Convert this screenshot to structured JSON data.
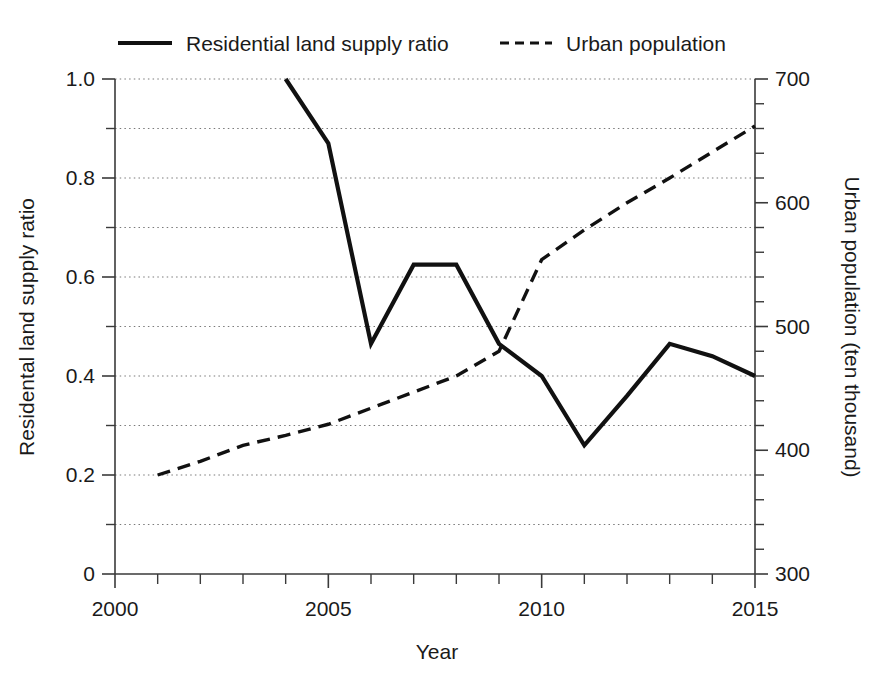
{
  "chart_data": {
    "type": "line",
    "title": "",
    "xlabel": "Year",
    "ylabel": "Residental land supply ratio",
    "y2label": "Urban population (ten thousand)",
    "xlim": [
      2000,
      2015
    ],
    "ylim": [
      0,
      1.0
    ],
    "y2lim": [
      300,
      700
    ],
    "grid": true,
    "legend_position": "top",
    "x_ticks": [
      2000,
      2001,
      2002,
      2003,
      2004,
      2005,
      2006,
      2007,
      2008,
      2009,
      2010,
      2011,
      2012,
      2013,
      2014,
      2015
    ],
    "x_tick_labels": [
      "2000",
      "",
      "",
      "",
      "",
      "2005",
      "",
      "",
      "",
      "",
      "2010",
      "",
      "",
      "",
      "",
      "2015"
    ],
    "y_ticks": [
      0,
      0.1,
      0.2,
      0.3,
      0.4,
      0.5,
      0.6,
      0.7,
      0.8,
      0.9,
      1.0
    ],
    "y_tick_labels": [
      "0",
      "",
      "0.2",
      "",
      "0.4",
      "",
      "0.6",
      "",
      "0.8",
      "",
      "1.0"
    ],
    "y2_ticks": [
      300,
      320,
      340,
      360,
      380,
      400,
      420,
      440,
      460,
      480,
      500,
      520,
      540,
      560,
      580,
      600,
      620,
      640,
      660,
      680,
      700
    ],
    "y2_tick_labels": [
      "300",
      "",
      "",
      "",
      "",
      "400",
      "",
      "",
      "",
      "",
      "500",
      "",
      "",
      "",
      "",
      "600",
      "",
      "",
      "",
      "",
      "700"
    ],
    "series": [
      {
        "name": "Residential land supply ratio",
        "axis": "left",
        "style": "solid",
        "x": [
          2004,
          2005,
          2006,
          2007,
          2008,
          2009,
          2010,
          2011,
          2012,
          2013,
          2014,
          2015
        ],
        "values": [
          1.0,
          0.87,
          0.465,
          0.625,
          0.625,
          0.465,
          0.4,
          0.26,
          0.36,
          0.465,
          0.44,
          0.4
        ]
      },
      {
        "name": "Urban population",
        "axis": "right",
        "style": "dashed",
        "x": [
          2001,
          2002,
          2003,
          2004,
          2005,
          2006,
          2007,
          2008,
          2009,
          2010,
          2011,
          2012,
          2013,
          2014,
          2015
        ],
        "values": [
          380,
          391,
          404,
          412,
          421,
          434,
          447,
          460,
          480,
          554,
          578,
          600,
          620,
          641,
          662
        ]
      }
    ]
  },
  "legend": {
    "items": [
      {
        "label": "Residential land supply ratio",
        "style": "solid"
      },
      {
        "label": "Urban population",
        "style": "dashed"
      }
    ]
  },
  "axes": {
    "x_title": "Year",
    "y_left_title": "Residental land supply ratio",
    "y_right_title": "Urban population (ten thousand)"
  },
  "colors": {
    "line": "#111111",
    "axis": "#3a3a3a",
    "grid": "#7a7a7a",
    "background": "#ffffff"
  }
}
